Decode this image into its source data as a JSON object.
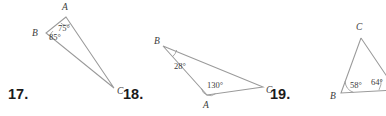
{
  "page": {
    "kind": "geometry-worksheet-triangles",
    "background_color": "#ffffff",
    "line_color": "#9a9a9a",
    "text_color": "#3b3b3b",
    "number_color": "#1a1a1a",
    "width": 386,
    "height": 116
  },
  "problems": [
    {
      "number": "17.",
      "number_pos": {
        "x": 8,
        "y": 86
      },
      "vertices": [
        {
          "label": "A",
          "x": 66,
          "y": 17,
          "label_x": 62,
          "label_y": 10
        },
        {
          "label": "B",
          "x": 46,
          "y": 33,
          "label_x": 32,
          "label_y": 36
        },
        {
          "label": "C",
          "x": 114,
          "y": 88,
          "label_x": 117,
          "label_y": 94
        }
      ],
      "angles": [
        {
          "value": "75°",
          "at": "A",
          "label_x": 58,
          "label_y": 31
        },
        {
          "value": "85°",
          "at": "B",
          "label_x": 49,
          "label_y": 38
        }
      ]
    },
    {
      "number": "18.",
      "number_pos": {
        "x": 123,
        "y": 86
      },
      "vertices": [
        {
          "label": "B",
          "x": 163,
          "y": 46,
          "label_x": 154,
          "label_y": 44
        },
        {
          "label": "A",
          "x": 207,
          "y": 95,
          "label_x": 203,
          "label_y": 108
        },
        {
          "label": "C",
          "x": 263,
          "y": 87,
          "label_x": 266,
          "label_y": 93
        }
      ],
      "angles": [
        {
          "value": "28°",
          "at": "B",
          "label_x": 174,
          "label_y": 67
        },
        {
          "value": "130°",
          "at": "A",
          "label_x": 207,
          "label_y": 88
        }
      ]
    },
    {
      "number": "19.",
      "number_pos": {
        "x": 270,
        "y": 86
      },
      "vertices": [
        {
          "label": "C",
          "x": 361,
          "y": 38,
          "label_x": 356,
          "label_y": 30
        },
        {
          "label": "B",
          "x": 341,
          "y": 93,
          "label_x": 330,
          "label_y": 99
        }
      ],
      "angles": [
        {
          "value": "58°",
          "at": "B",
          "label_x": 350,
          "label_y": 86
        },
        {
          "value": "64°",
          "at": "right",
          "label_x": 372,
          "label_y": 83
        }
      ]
    }
  ]
}
